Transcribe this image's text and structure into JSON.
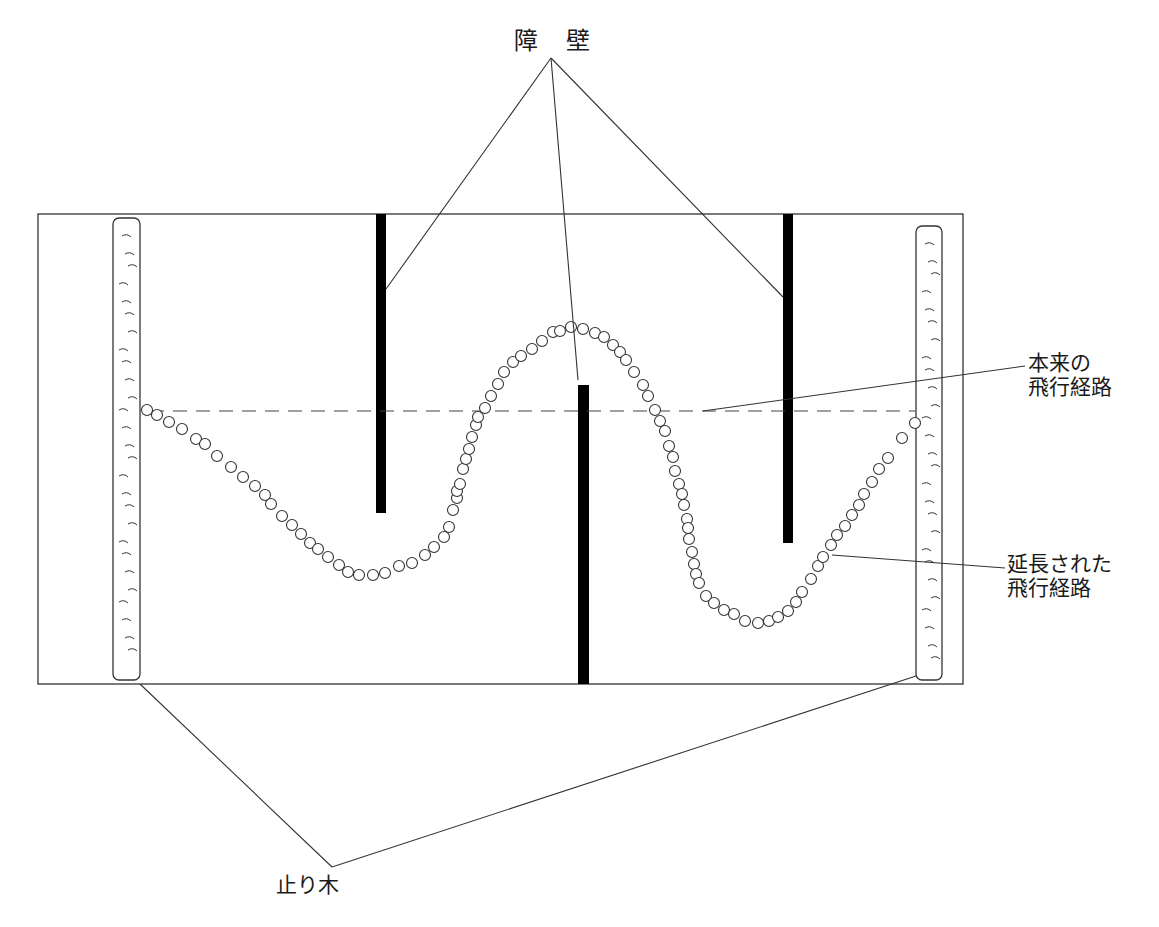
{
  "figure": {
    "labels": {
      "barrier": "障 壁",
      "original_path_line1": "本来の",
      "original_path_line2": "飛行経路",
      "extended_path_line1": "延長された",
      "extended_path_line2": "飛行経路",
      "perch": "止り木"
    },
    "colors": {
      "stroke": "#333333",
      "barrier_fill": "#000000",
      "background": "#ffffff"
    },
    "enclosure": {
      "x": 38,
      "y": 214,
      "width": 925,
      "height": 470
    },
    "barriers": [
      {
        "name": "barrier-left",
        "x": 376,
        "y": 214,
        "width": 10,
        "height": 299
      },
      {
        "name": "barrier-center",
        "x": 578,
        "y": 385,
        "width": 11,
        "height": 299
      },
      {
        "name": "barrier-right",
        "x": 783,
        "y": 214,
        "width": 10,
        "height": 329
      }
    ],
    "perches": [
      {
        "name": "perch-left",
        "x": 113,
        "y": 218,
        "width": 27,
        "height": 462
      },
      {
        "name": "perch-right",
        "x": 916,
        "y": 226,
        "width": 26,
        "height": 454
      }
    ],
    "original_path": {
      "x1": 150,
      "y1": 411,
      "x2": 915,
      "y2": 411
    },
    "extended_path_points": [
      [
        147,
        410
      ],
      [
        157,
        415
      ],
      [
        169,
        422
      ],
      [
        182,
        429
      ],
      [
        196,
        439
      ],
      [
        205,
        444
      ],
      [
        217,
        456
      ],
      [
        231,
        467
      ],
      [
        243,
        477
      ],
      [
        255,
        486
      ],
      [
        265,
        495
      ],
      [
        271,
        504
      ],
      [
        282,
        516
      ],
      [
        292,
        525
      ],
      [
        301,
        534
      ],
      [
        310,
        543
      ],
      [
        318,
        549
      ],
      [
        328,
        557
      ],
      [
        339,
        565
      ],
      [
        348,
        572
      ],
      [
        359,
        575
      ],
      [
        373,
        575
      ],
      [
        385,
        573
      ],
      [
        399,
        566
      ],
      [
        412,
        563
      ],
      [
        425,
        555
      ],
      [
        434,
        547
      ],
      [
        444,
        537
      ],
      [
        449,
        527
      ],
      [
        453,
        510
      ],
      [
        457,
        498
      ],
      [
        457,
        491
      ],
      [
        460,
        484
      ],
      [
        463,
        469
      ],
      [
        466,
        459
      ],
      [
        469,
        449
      ],
      [
        472,
        437
      ],
      [
        476,
        425
      ],
      [
        478,
        417
      ],
      [
        485,
        408
      ],
      [
        491,
        396
      ],
      [
        498,
        384
      ],
      [
        504,
        372
      ],
      [
        513,
        362
      ],
      [
        521,
        356
      ],
      [
        532,
        349
      ],
      [
        542,
        341
      ],
      [
        553,
        332
      ],
      [
        560,
        331
      ],
      [
        571,
        327
      ],
      [
        583,
        329
      ],
      [
        595,
        333
      ],
      [
        604,
        337
      ],
      [
        613,
        345
      ],
      [
        620,
        352
      ],
      [
        626,
        360
      ],
      [
        634,
        372
      ],
      [
        643,
        385
      ],
      [
        648,
        396
      ],
      [
        655,
        410
      ],
      [
        660,
        421
      ],
      [
        665,
        431
      ],
      [
        669,
        446
      ],
      [
        673,
        457
      ],
      [
        675,
        471
      ],
      [
        679,
        484
      ],
      [
        682,
        494
      ],
      [
        684,
        505
      ],
      [
        687,
        519
      ],
      [
        688,
        528
      ],
      [
        689,
        539
      ],
      [
        692,
        552
      ],
      [
        694,
        564
      ],
      [
        696,
        574
      ],
      [
        699,
        583
      ],
      [
        706,
        596
      ],
      [
        714,
        603
      ],
      [
        724,
        610
      ],
      [
        734,
        614
      ],
      [
        745,
        621
      ],
      [
        758,
        623
      ],
      [
        769,
        621
      ],
      [
        778,
        617
      ],
      [
        788,
        611
      ],
      [
        796,
        602
      ],
      [
        802,
        592
      ],
      [
        811,
        579
      ],
      [
        818,
        566
      ],
      [
        823,
        557
      ],
      [
        831,
        545
      ],
      [
        837,
        535
      ],
      [
        845,
        526
      ],
      [
        852,
        515
      ],
      [
        859,
        505
      ],
      [
        864,
        494
      ],
      [
        872,
        482
      ],
      [
        879,
        469
      ],
      [
        888,
        458
      ],
      [
        902,
        438
      ],
      [
        915,
        423
      ]
    ],
    "leaders": {
      "barrier": [
        {
          "x1": 551,
          "y1": 58,
          "x2": 386,
          "y2": 289
        },
        {
          "x1": 551,
          "y1": 58,
          "x2": 578,
          "y2": 380
        },
        {
          "x1": 551,
          "y1": 58,
          "x2": 783,
          "y2": 297
        }
      ],
      "original_path": {
        "x1": 1025,
        "y1": 366,
        "x2": 703,
        "y2": 411
      },
      "extended_path": {
        "x1": 1005,
        "y1": 568,
        "x2": 832,
        "y2": 555
      },
      "perch": [
        {
          "x1": 332,
          "y1": 867,
          "x2": 140,
          "y2": 684
        },
        {
          "x1": 332,
          "y1": 867,
          "x2": 916,
          "y2": 676
        }
      ]
    }
  }
}
